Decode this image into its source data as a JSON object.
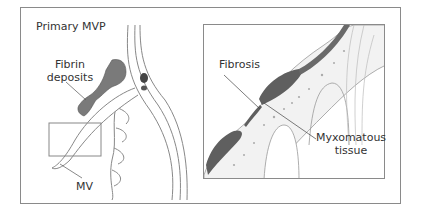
{
  "figure": {
    "title": "Primary MVP",
    "left_panel": {
      "labels": {
        "fibrin": "Fibrin deposits",
        "fibrin_line1": "Fibrin",
        "fibrin_line2": "deposits",
        "mv": "MV"
      }
    },
    "right_panel": {
      "labels": {
        "fibrosis": "Fibrosis",
        "myxo_line1": "Myxomatous",
        "myxo_line2": "tissue"
      }
    },
    "colors": {
      "outline": "#8a8a8a",
      "deposit": "#7a7a7a",
      "fibrosis": "#5f5f5f",
      "tissue_fill": "#f2f2f2",
      "text": "#333333"
    }
  }
}
